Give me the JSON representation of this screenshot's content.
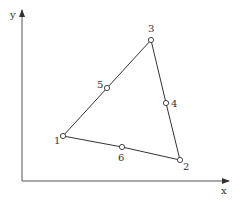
{
  "diagram": {
    "type": "triangular-element",
    "axes": {
      "x_label": "x",
      "y_label": "y",
      "origin": [
        22,
        181
      ],
      "x_end": [
        229,
        181
      ],
      "y_end": [
        22,
        10
      ]
    },
    "nodes": [
      {
        "id": "1",
        "label": "1",
        "x": 63,
        "y": 136,
        "label_x": 54,
        "label_y": 144
      },
      {
        "id": "2",
        "label": "2",
        "x": 180,
        "y": 160,
        "label_x": 183,
        "label_y": 170
      },
      {
        "id": "3",
        "label": "3",
        "x": 151,
        "y": 40,
        "label_x": 148,
        "label_y": 32
      },
      {
        "id": "4",
        "label": "4",
        "x": 166,
        "y": 103,
        "label_x": 171,
        "label_y": 107
      },
      {
        "id": "5",
        "label": "5",
        "x": 107,
        "y": 88,
        "label_x": 97,
        "label_y": 88
      },
      {
        "id": "6",
        "label": "6",
        "x": 122,
        "y": 147,
        "label_x": 118,
        "label_y": 161
      }
    ],
    "edges": [
      [
        "1",
        "5",
        "3"
      ],
      [
        "3",
        "4",
        "2"
      ],
      [
        "2",
        "6",
        "1"
      ]
    ],
    "colors": {
      "line": "#333333",
      "axis": "#444444",
      "node_fill": "#ffffff"
    }
  }
}
